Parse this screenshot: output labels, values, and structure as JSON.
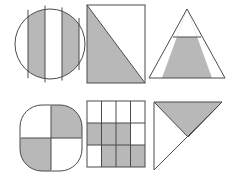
{
  "figure": {
    "background_color": "#ffffff",
    "shade_color": "#b8b8b8",
    "stroke_color": "#4a4a4a",
    "stroke_width": 1,
    "rows": 2,
    "columns": 3,
    "shape_count": 6
  },
  "shapes": [
    {
      "id": "circle-fourths",
      "name": "Circle divided into four vertical strips",
      "outline": "circle",
      "position": {
        "row": 1,
        "column": 1
      },
      "partitions": 4,
      "partition_direction": "vertical",
      "shaded_parts": 2,
      "shaded_indices": [
        1,
        3
      ],
      "fraction": "2/4",
      "label": "Circle in vertical fourths, two strips shaded"
    },
    {
      "id": "rect-diagonal",
      "name": "Rectangle split by a diagonal",
      "outline": "rectangle",
      "position": {
        "row": 1,
        "column": 2
      },
      "partitions": 2,
      "partition_direction": "diagonal-top-left-to-bottom-right",
      "shaded_parts": 1,
      "shaded_indices": [
        0
      ],
      "fraction": "1/2",
      "label": "Rectangle halved by diagonal, lower-left half shaded"
    },
    {
      "id": "triangle-trapezoid",
      "name": "Triangle split by a horizontal line",
      "outline": "triangle",
      "position": {
        "row": 1,
        "column": 3
      },
      "partitions": 2,
      "partition_direction": "horizontal",
      "shaded_parts": 1,
      "shaded_indices": [
        1
      ],
      "fraction": "lower trapezoid",
      "label": "Triangle cut horizontally, bottom trapezoid shaded"
    },
    {
      "id": "rounded-square",
      "name": "Rounded square in quarters",
      "outline": "rounded-square",
      "position": {
        "row": 2,
        "column": 1
      },
      "partitions": 4,
      "partition_direction": "quadrants",
      "shaded_parts": 2,
      "shaded_indices": [
        1,
        2
      ],
      "fraction": "2/4",
      "label": "Rounded square in quarters, top-right and bottom-left shaded"
    },
    {
      "id": "grid-four-by-three",
      "name": "Four by three grid of squares",
      "outline": "square-grid",
      "position": {
        "row": 2,
        "column": 2
      },
      "grid_columns": 4,
      "grid_rows": 3,
      "partitions": 12,
      "shaded_parts": 7,
      "cells": [
        [
          0,
          0,
          0,
          0
        ],
        [
          1,
          1,
          1,
          0
        ],
        [
          0,
          1,
          1,
          1
        ]
      ],
      "fraction": "7/12",
      "label": "Twelve-cell grid with seven cells shaded"
    },
    {
      "id": "right-triangle",
      "name": "Right triangle split into halves",
      "outline": "right-triangle",
      "position": {
        "row": 2,
        "column": 3
      },
      "partitions": 2,
      "partition_direction": "median-to-hypotenuse",
      "shaded_parts": 1,
      "shaded_indices": [
        0
      ],
      "fraction": "1/2",
      "label": "Right triangle with upper half shaded"
    }
  ]
}
